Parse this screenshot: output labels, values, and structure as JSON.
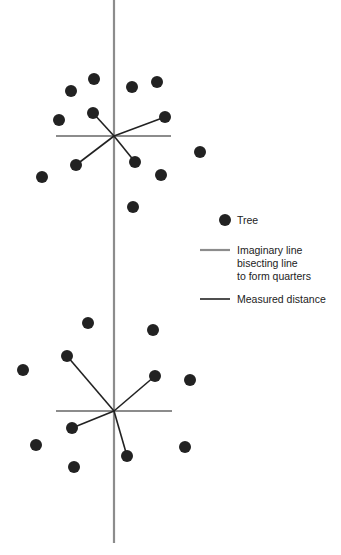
{
  "colors": {
    "tree": "#222222",
    "bisecting_line": "#8c8c8c",
    "measured_line": "#222222",
    "background": "#ffffff"
  },
  "axis": {
    "x": 114,
    "y_top": 0,
    "y_bottom": 543
  },
  "plots": [
    {
      "center": [
        114,
        136
      ],
      "hline": [
        56,
        171
      ],
      "trees": [
        [
          94,
          79
        ],
        [
          71,
          91
        ],
        [
          132,
          87
        ],
        [
          157,
          82
        ],
        [
          93,
          113
        ],
        [
          59,
          120
        ],
        [
          165,
          117
        ],
        [
          76,
          165
        ],
        [
          135,
          162
        ],
        [
          161,
          175
        ],
        [
          200,
          152
        ],
        [
          42,
          177
        ],
        [
          133,
          207
        ]
      ],
      "measured": [
        [
          93,
          113
        ],
        [
          165,
          117
        ],
        [
          76,
          165
        ],
        [
          135,
          162
        ]
      ]
    },
    {
      "center": [
        114,
        411
      ],
      "hline": [
        56,
        172
      ],
      "trees": [
        [
          88,
          323
        ],
        [
          153,
          330
        ],
        [
          67,
          356
        ],
        [
          23,
          370
        ],
        [
          155,
          376
        ],
        [
          190,
          380
        ],
        [
          72,
          428
        ],
        [
          36,
          445
        ],
        [
          127,
          456
        ],
        [
          185,
          447
        ],
        [
          74,
          467
        ]
      ],
      "measured": [
        [
          67,
          356
        ],
        [
          155,
          376
        ],
        [
          72,
          428
        ],
        [
          127,
          456
        ]
      ]
    }
  ],
  "legend": {
    "tree_label": "Tree",
    "bisect_label_lines": [
      "Imaginary line",
      "bisecting line",
      "to form quarters"
    ],
    "measured_label": "Measured distance"
  }
}
